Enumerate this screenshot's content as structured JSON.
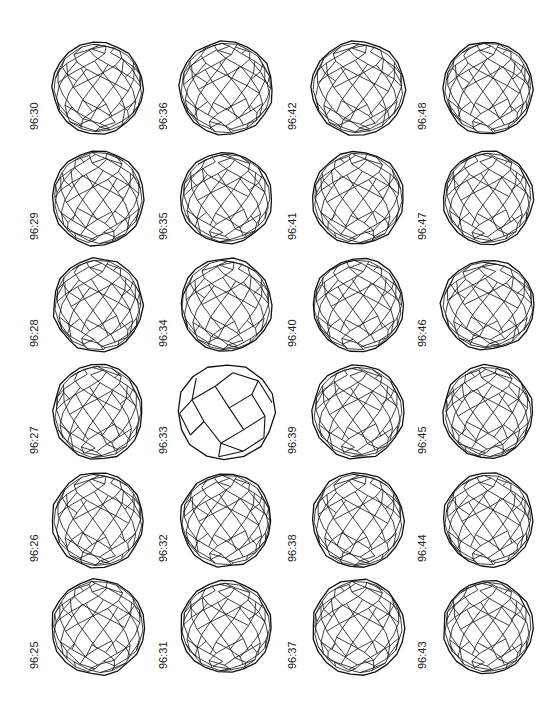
{
  "figure": {
    "columns": [
      {
        "x_label": 35,
        "x_cage": 98,
        "isomers": [
          {
            "label": "96:30",
            "y": 88,
            "rx": 46,
            "ry": 46,
            "seed": 30
          },
          {
            "label": "96:29",
            "y": 198,
            "rx": 46,
            "ry": 48,
            "seed": 29
          },
          {
            "label": "96:28",
            "y": 305,
            "rx": 45,
            "ry": 47,
            "seed": 28
          },
          {
            "label": "96:27",
            "y": 412,
            "rx": 45,
            "ry": 48,
            "seed": 27
          },
          {
            "label": "96:26",
            "y": 520,
            "rx": 46,
            "ry": 48,
            "seed": 26
          },
          {
            "label": "96:25",
            "y": 627,
            "rx": 47,
            "ry": 48,
            "seed": 25
          }
        ]
      },
      {
        "x_label": 164,
        "x_cage": 226,
        "isomers": [
          {
            "label": "96:36",
            "y": 88,
            "rx": 47,
            "ry": 47,
            "seed": 36
          },
          {
            "label": "96:35",
            "y": 198,
            "rx": 46,
            "ry": 46,
            "seed": 35
          },
          {
            "label": "96:34",
            "y": 305,
            "rx": 46,
            "ry": 47,
            "seed": 34
          },
          {
            "label": "96:33",
            "y": 412,
            "rx": 49,
            "ry": 48,
            "seed": 33,
            "simple": true
          },
          {
            "label": "96:32",
            "y": 520,
            "rx": 46,
            "ry": 47,
            "seed": 32
          },
          {
            "label": "96:31",
            "y": 627,
            "rx": 46,
            "ry": 46,
            "seed": 31
          }
        ]
      },
      {
        "x_label": 293,
        "x_cage": 358,
        "isomers": [
          {
            "label": "96:42",
            "y": 88,
            "rx": 47,
            "ry": 47,
            "seed": 42
          },
          {
            "label": "96:41",
            "y": 198,
            "rx": 46,
            "ry": 47,
            "seed": 41
          },
          {
            "label": "96:40",
            "y": 305,
            "rx": 46,
            "ry": 47,
            "seed": 40
          },
          {
            "label": "96:39",
            "y": 412,
            "rx": 46,
            "ry": 47,
            "seed": 39
          },
          {
            "label": "96:38",
            "y": 520,
            "rx": 46,
            "ry": 48,
            "seed": 38
          },
          {
            "label": "96:37",
            "y": 627,
            "rx": 46,
            "ry": 48,
            "seed": 37
          }
        ]
      },
      {
        "x_label": 423,
        "x_cage": 488,
        "isomers": [
          {
            "label": "96:48",
            "y": 88,
            "rx": 45,
            "ry": 47,
            "seed": 48
          },
          {
            "label": "96:47",
            "y": 198,
            "rx": 45,
            "ry": 47,
            "seed": 47
          },
          {
            "label": "96:46",
            "y": 305,
            "rx": 47,
            "ry": 45,
            "seed": 46
          },
          {
            "label": "96:45",
            "y": 412,
            "rx": 45,
            "ry": 47,
            "seed": 45
          },
          {
            "label": "96:44",
            "y": 520,
            "rx": 45,
            "ry": 47,
            "seed": 44
          },
          {
            "label": "96:43",
            "y": 627,
            "rx": 45,
            "ry": 47,
            "seed": 43
          }
        ]
      }
    ]
  },
  "style": {
    "stroke": "#111111",
    "background": "#ffffff",
    "label_color": "#222222"
  }
}
